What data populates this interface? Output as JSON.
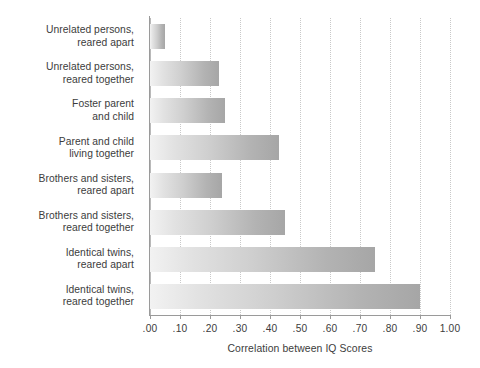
{
  "chart_data": {
    "type": "bar",
    "orientation": "horizontal",
    "title": "",
    "xlabel": "Correlation between IQ Scores",
    "ylabel": "",
    "xlim": [
      0.0,
      1.0
    ],
    "grid": true,
    "legend": null,
    "categories": [
      "Unrelated persons, reared apart",
      "Unrelated persons, reared together",
      "Foster parent and child",
      "Parent and child living together",
      "Brothers and sisters, reared apart",
      "Brothers and sisters, reared together",
      "Identical twins, reared apart",
      "Identical twins, reared together"
    ],
    "category_lines": [
      [
        "Unrelated persons,",
        "reared apart"
      ],
      [
        "Unrelated persons,",
        "reared together"
      ],
      [
        "Foster parent",
        "and child"
      ],
      [
        "Parent and child",
        "living together"
      ],
      [
        "Brothers and sisters,",
        "reared apart"
      ],
      [
        "Brothers and sisters,",
        "reared together"
      ],
      [
        "Identical twins,",
        "reared apart"
      ],
      [
        "Identical twins,",
        "reared together"
      ]
    ],
    "values": [
      0.05,
      0.23,
      0.25,
      0.43,
      0.24,
      0.45,
      0.75,
      0.9
    ],
    "xticks": [
      0.0,
      0.1,
      0.2,
      0.3,
      0.4,
      0.5,
      0.6,
      0.7,
      0.8,
      0.9,
      1.0
    ],
    "xticklabels": [
      ".00",
      ".10",
      ".20",
      ".30",
      ".40",
      ".50",
      ".60",
      ".70",
      ".80",
      ".90",
      "1.00"
    ],
    "colors": {
      "bar_gradient_start": "#f2f2f2",
      "bar_gradient_end": "#a6a6a6",
      "gridline": "#c9c9c9",
      "axis": "#9a9a9a",
      "text": "#3c3c3c",
      "background": "#ffffff"
    }
  }
}
